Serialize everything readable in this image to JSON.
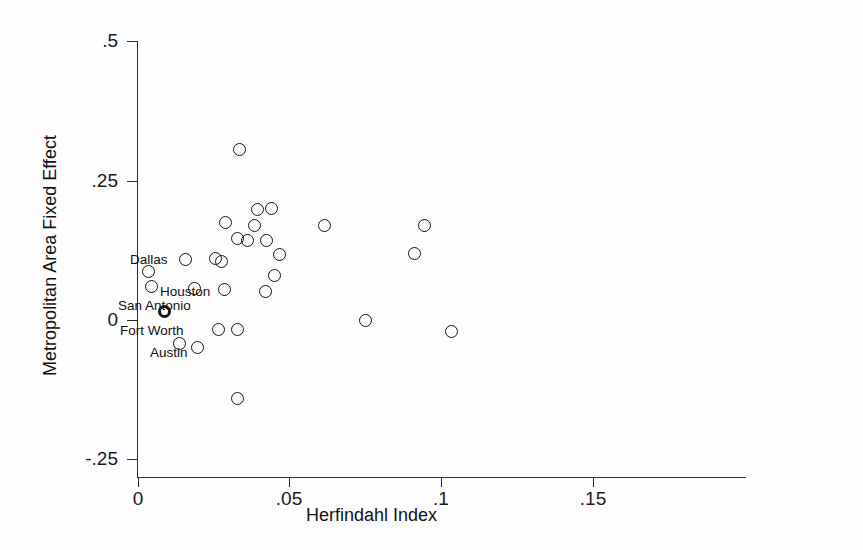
{
  "chart_data": {
    "type": "scatter",
    "title": "",
    "xlabel": "Herfindahl Index",
    "ylabel": "Metropolitan Area Fixed Effect",
    "xlim": [
      0,
      0.15
    ],
    "ylim": [
      -0.25,
      0.5
    ],
    "grid": false,
    "legend": null,
    "xticks": [
      0,
      0.05,
      0.1,
      0.15
    ],
    "xtick_labels": [
      "0",
      ".05",
      ".1",
      ".15"
    ],
    "yticks": [
      0.5,
      0.25,
      0,
      -0.25
    ],
    "ytick_labels": [
      ".5",
      ".25",
      "0",
      "-.25"
    ],
    "marker_style": "open-circle",
    "points": [
      {
        "x": 0.0335,
        "y": 0.3055,
        "label": "",
        "bold": false
      },
      {
        "x": 0.0615,
        "y": 0.1685,
        "label": "",
        "bold": false
      },
      {
        "x": 0.0465,
        "y": 0.1175,
        "label": "",
        "bold": false
      },
      {
        "x": 0.044,
        "y": 0.2,
        "label": "",
        "bold": false
      },
      {
        "x": 0.0395,
        "y": 0.1975,
        "label": "",
        "bold": false
      },
      {
        "x": 0.029,
        "y": 0.1745,
        "label": "",
        "bold": false
      },
      {
        "x": 0.0385,
        "y": 0.169,
        "label": "",
        "bold": false
      },
      {
        "x": 0.0327,
        "y": 0.1465,
        "label": "",
        "bold": false
      },
      {
        "x": 0.036,
        "y": 0.142,
        "label": "",
        "bold": false
      },
      {
        "x": 0.0424,
        "y": 0.1415,
        "label": "",
        "bold": false
      },
      {
        "x": 0.045,
        "y": 0.079,
        "label": "",
        "bold": false
      },
      {
        "x": 0.0421,
        "y": 0.051,
        "label": "",
        "bold": false
      },
      {
        "x": 0.0155,
        "y": 0.1085,
        "label": "",
        "bold": false
      },
      {
        "x": 0.0257,
        "y": 0.1105,
        "label": "",
        "bold": false
      },
      {
        "x": 0.0276,
        "y": 0.105,
        "label": "",
        "bold": false
      },
      {
        "x": 0.0036,
        "y": 0.0865,
        "label": "Dallas",
        "bold": false
      },
      {
        "x": 0.0046,
        "y": 0.0595,
        "label": "Houston",
        "bold": false
      },
      {
        "x": 0.0086,
        "y": 0.0155,
        "label": "San Antonio",
        "bold": true
      },
      {
        "x": 0.0136,
        "y": -0.043,
        "label": "Austin",
        "bold": false
      },
      {
        "x": 0.0186,
        "y": 0.0555,
        "label": "",
        "bold": false
      },
      {
        "x": 0.0286,
        "y": 0.0545,
        "label": "",
        "bold": false
      },
      {
        "x": 0.0196,
        "y": -0.0495,
        "label": "",
        "bold": false
      },
      {
        "x": 0.0265,
        "y": -0.0175,
        "label": "",
        "bold": false
      },
      {
        "x": 0.0327,
        "y": -0.018,
        "label": "",
        "bold": false
      },
      {
        "x": 0.0327,
        "y": -0.142,
        "label": "",
        "bold": false
      },
      {
        "x": 0.091,
        "y": 0.1185,
        "label": "",
        "bold": false
      },
      {
        "x": 0.0945,
        "y": 0.1685,
        "label": "",
        "bold": false
      },
      {
        "x": 0.1035,
        "y": -0.0215,
        "label": "",
        "bold": false
      },
      {
        "x": 0.075,
        "y": -0.0015,
        "label": "",
        "bold": false
      }
    ],
    "point_labels": [
      {
        "text": "Dallas",
        "x_px": 130,
        "y_px": 252
      },
      {
        "text": "Houston",
        "x_px": 160,
        "y_px": 284
      },
      {
        "text": "San Antonio",
        "x_px": 118,
        "y_px": 298
      },
      {
        "text": "Fort Worth",
        "x_px": 120,
        "y_px": 323
      },
      {
        "text": "Austin",
        "x_px": 150,
        "y_px": 345
      }
    ]
  }
}
